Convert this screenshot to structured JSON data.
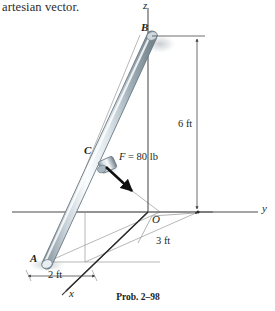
{
  "header": {
    "text": "artesian vector."
  },
  "caption": {
    "text": "Prob. 2–98"
  },
  "axes": {
    "z_label": "z",
    "y_label": "y",
    "x_label": "x",
    "origin_label": "O"
  },
  "points": {
    "A": "A",
    "B": "B",
    "C": "C"
  },
  "force": {
    "symbol": "F",
    "equals": " = 80 lb",
    "full_label": "F = 80 lb",
    "magnitude": 80,
    "unit": "lb"
  },
  "dimensions": [
    {
      "name": "height-6ft",
      "label": "6 ft",
      "value": 6,
      "unit": "ft"
    },
    {
      "name": "depth-3ft",
      "label": "3 ft",
      "value": 3,
      "unit": "ft"
    },
    {
      "name": "width-2ft",
      "label": "2 ft",
      "value": 2,
      "unit": "ft"
    }
  ],
  "colors": {
    "ink": "#231f20",
    "axis": "#4a4a4a",
    "construction": "#9a9a9a",
    "rod_light": "#f2f5f7",
    "rod_mid": "#b9c4cc",
    "rod_dark": "#7d8c96",
    "arrow": "#101010"
  }
}
